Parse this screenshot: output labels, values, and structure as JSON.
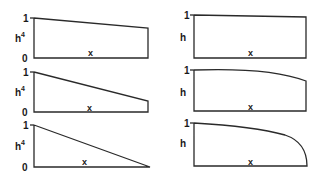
{
  "diagram": {
    "left_column": {
      "y_label": "h",
      "y_label_superscript": "4",
      "x_label": "x",
      "tick_top": "1",
      "tick_bottom": "0",
      "panels": [
        {
          "top_left": 1.0,
          "top_right": 0.75
        },
        {
          "top_left": 1.0,
          "top_right": 0.27
        },
        {
          "top_left": 1.0,
          "top_right": 0.0
        }
      ]
    },
    "right_column": {
      "y_label": "h",
      "x_label": "x",
      "tick_top": "1",
      "panels": [
        {
          "top_left": 1.0,
          "top_right": 0.93
        },
        {
          "top_left": 1.0,
          "top_right": 0.72
        },
        {
          "top_left": 1.0,
          "top_right": 0.0
        }
      ]
    }
  }
}
